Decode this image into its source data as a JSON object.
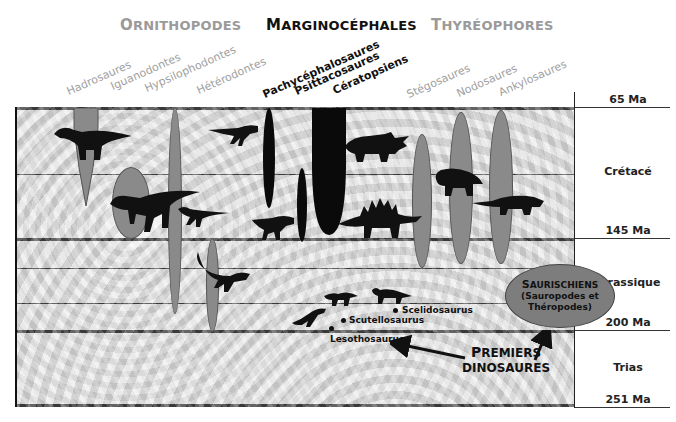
{
  "header": {
    "groups": [
      {
        "label_first": "O",
        "label_rest": "RNITHOPODES",
        "color": "#9a9a9a"
      },
      {
        "label_first": "M",
        "label_rest": "ARGINOCÉPHALES",
        "color": "#111111"
      },
      {
        "label_first": "T",
        "label_rest": "HYRÉOPHORES",
        "color": "#9a9a9a"
      }
    ],
    "clades": [
      {
        "name": "Hadrosaures",
        "group": "Ornithopodes"
      },
      {
        "name": "Iguanodontes",
        "group": "Ornithopodes"
      },
      {
        "name": "Hypsilophodontes",
        "group": "Ornithopodes"
      },
      {
        "name": "Hétérodontes",
        "group": "Ornithopodes"
      },
      {
        "name": "Pachycéphalosaures",
        "group": "Marginocéphales"
      },
      {
        "name": "Psittacosaures",
        "group": "Marginocéphales"
      },
      {
        "name": "Cératopsiens",
        "group": "Marginocéphales"
      },
      {
        "name": "Stégosaures",
        "group": "Thyréophores"
      },
      {
        "name": "Nodosaures",
        "group": "Thyréophores"
      },
      {
        "name": "Ankylosaures",
        "group": "Thyréophores"
      }
    ]
  },
  "timescale": {
    "boundaries": [
      "65 Ma",
      "145 Ma",
      "200 Ma",
      "251 Ma"
    ],
    "periods": [
      "Crétacé",
      "Jurassique",
      "Trias"
    ]
  },
  "annotations": {
    "genera": [
      "Scelidosaurus",
      "Scutellosaurus",
      "Lesothosaurus"
    ],
    "saurischiens_title_first": "S",
    "saurischiens_title_rest": "AURISCHIENS",
    "saurischiens_line2": "(Sauropodes et",
    "saurischiens_line3": "Théropodes)",
    "premiers_line1_first": "P",
    "premiers_line1_rest": "REMIERS",
    "premiers_line2": "DINOSAURES"
  },
  "colors": {
    "spindle_grey": "#8a8a8a",
    "spindle_black": "#0a0a0a",
    "background_texture": "#d9d9d9",
    "line": "#111111"
  }
}
